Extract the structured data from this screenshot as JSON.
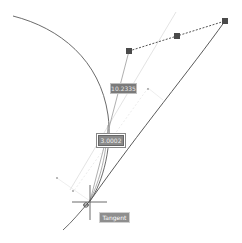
{
  "drawing": {
    "dimension_value": "10.2335",
    "second_dimension_value": "3.0002",
    "snap_tooltip": "Tangent"
  },
  "icons": {
    "grip": "square-grip-icon",
    "crosshair": "crosshair-cursor-icon"
  },
  "colors": {
    "background": "#ffffff",
    "geometry": "#555555",
    "construction": "#d6d6d6",
    "grip": "#4a4a4a",
    "label_bg": "#7a7a7a"
  }
}
